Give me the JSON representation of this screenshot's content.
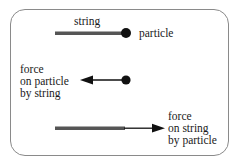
{
  "diagram": {
    "panel1": {
      "string_label": "string",
      "particle_label": "particle"
    },
    "panel2": {
      "force_label_lines": [
        "force",
        "on particle",
        "by string"
      ]
    },
    "panel3": {
      "force_label_lines": [
        "force",
        "on string",
        "by particle"
      ]
    },
    "colors": {
      "string_bar": "#555555",
      "particle": "#111111",
      "arrow": "#111111",
      "frame_border": "#8a8a8a"
    }
  }
}
